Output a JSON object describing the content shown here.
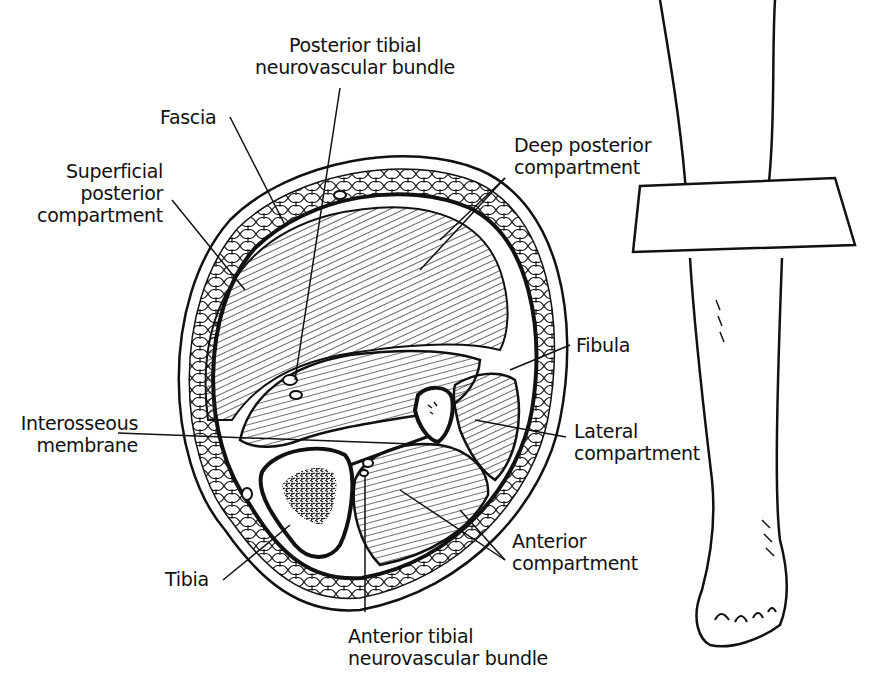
{
  "diagram": {
    "title_context": "Cross-section of lower leg compartments with leg reference view",
    "colors": {
      "ink": "#111111",
      "background": "#ffffff"
    },
    "labels": {
      "posterior_tibial_bundle": {
        "line1": "Posterior tibial",
        "line2": "neurovascular bundle"
      },
      "fascia": {
        "line1": "Fascia"
      },
      "superficial_posterior": {
        "line1": "Superficial",
        "line2": "posterior",
        "line3": "compartment"
      },
      "deep_posterior": {
        "line1": "Deep posterior",
        "line2": "compartment"
      },
      "fibula": {
        "line1": "Fibula"
      },
      "interosseous_membrane": {
        "line1": "Interosseous",
        "line2": "membrane"
      },
      "lateral_compartment": {
        "line1": "Lateral",
        "line2": "compartment"
      },
      "anterior_compartment": {
        "line1": "Anterior",
        "line2": "compartment"
      },
      "tibia": {
        "line1": "Tibia"
      },
      "anterior_tibial_bundle": {
        "line1": "Anterior tibial",
        "line2": "neurovascular bundle"
      }
    },
    "figures": [
      {
        "name": "leg-cross-section",
        "description": "Transverse section showing compartments, tibia, fibula and neurovascular bundles"
      },
      {
        "name": "leg-side-view",
        "description": "Lower leg and foot with a cutting plane indicating section level"
      }
    ]
  }
}
